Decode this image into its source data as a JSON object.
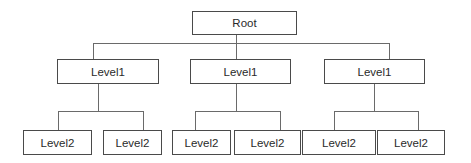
{
  "diagram": {
    "type": "org-chart",
    "root": {
      "label": "Root"
    },
    "level1": [
      {
        "label": "Level1",
        "children": [
          {
            "label": "Level2"
          },
          {
            "label": "Level2"
          }
        ]
      },
      {
        "label": "Level1",
        "children": [
          {
            "label": "Level2"
          },
          {
            "label": "Level2"
          }
        ]
      },
      {
        "label": "Level1",
        "children": [
          {
            "label": "Level2"
          },
          {
            "label": "Level2"
          }
        ]
      }
    ]
  }
}
